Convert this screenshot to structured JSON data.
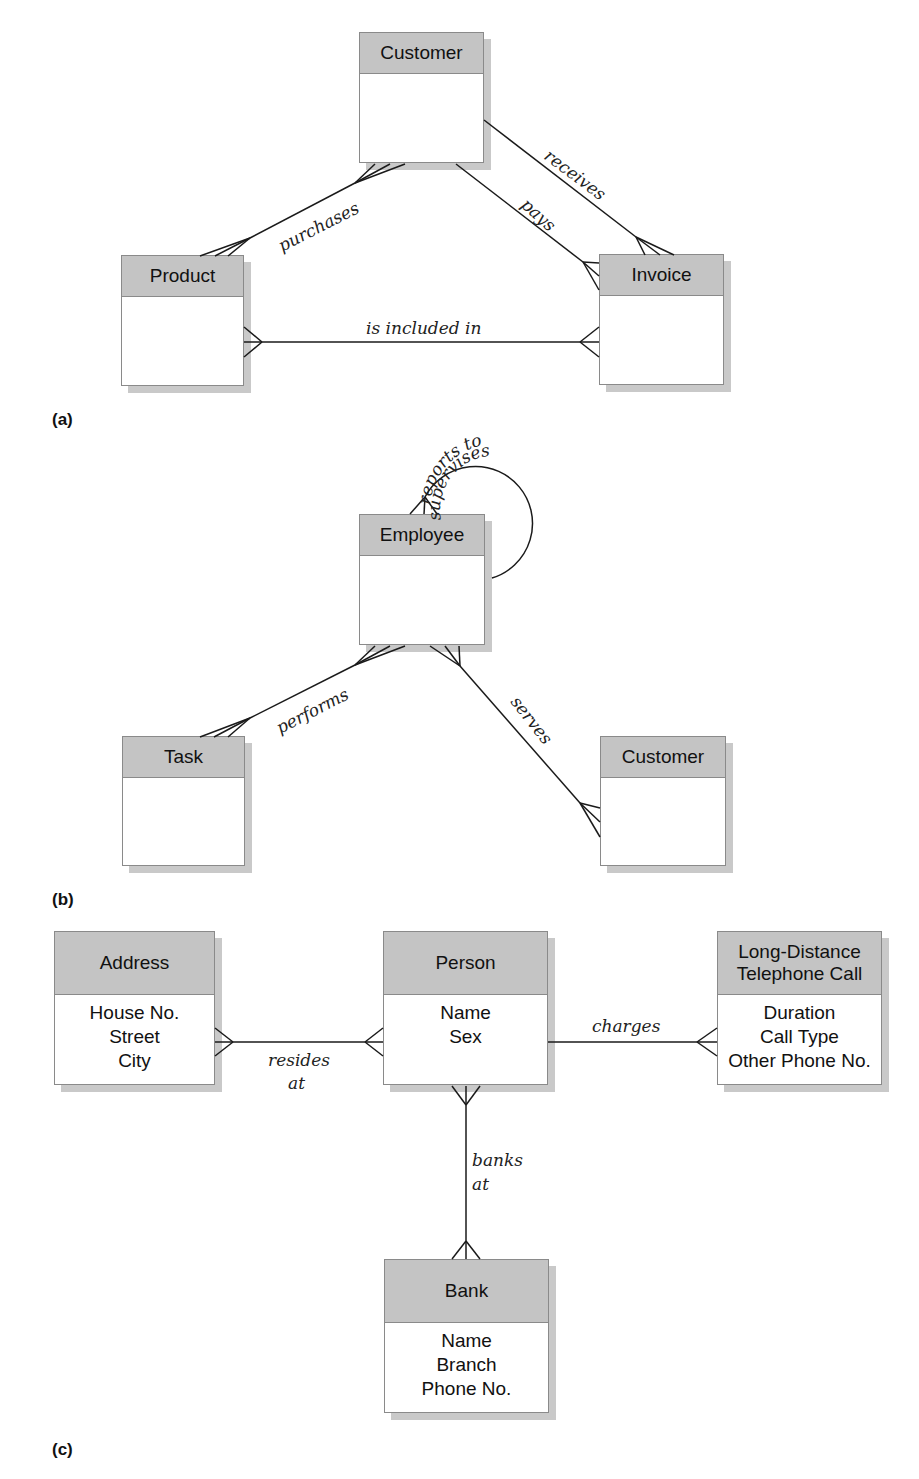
{
  "panels": [
    {
      "id": "a",
      "label": "(a)"
    },
    {
      "id": "b",
      "label": "(b)"
    },
    {
      "id": "c",
      "label": "(c)"
    }
  ],
  "entities": {
    "a_customer": {
      "name": "Customer",
      "attributes": []
    },
    "a_product": {
      "name": "Product",
      "attributes": []
    },
    "a_invoice": {
      "name": "Invoice",
      "attributes": []
    },
    "b_employee": {
      "name": "Employee",
      "attributes": []
    },
    "b_task": {
      "name": "Task",
      "attributes": []
    },
    "b_customer": {
      "name": "Customer",
      "attributes": []
    },
    "c_address": {
      "name": "Address",
      "attributes": [
        "House No.",
        "Street",
        "City"
      ]
    },
    "c_person": {
      "name": "Person",
      "attributes": [
        "Name",
        "Sex"
      ]
    },
    "c_call": {
      "name_line1": "Long-Distance",
      "name_line2": "Telephone Call",
      "attributes": [
        "Duration",
        "Call Type",
        "Other Phone No."
      ]
    },
    "c_bank": {
      "name": "Bank",
      "attributes": [
        "Name",
        "Branch",
        "Phone No."
      ]
    }
  },
  "relationships": {
    "purchases": {
      "label": "purchases",
      "from": "Customer",
      "to": "Product"
    },
    "receives": {
      "label": "receives",
      "from": "Customer",
      "to": "Invoice"
    },
    "pays": {
      "label": "pays",
      "from": "Customer",
      "to": "Invoice"
    },
    "is_included_in": {
      "label": "is included in",
      "from": "Product",
      "to": "Invoice"
    },
    "reports_to": {
      "label": "reports to",
      "from": "Employee",
      "to": "Employee"
    },
    "supervises": {
      "label": "supervises",
      "from": "Employee",
      "to": "Employee"
    },
    "performs": {
      "label": "performs",
      "from": "Employee",
      "to": "Task"
    },
    "serves": {
      "label": "serves",
      "from": "Employee",
      "to": "Customer"
    },
    "resides": {
      "label_line1": "resides",
      "label_line2": "at",
      "from": "Person",
      "to": "Address"
    },
    "charges": {
      "label": "charges",
      "from": "Person",
      "to": "Long-Distance Telephone Call"
    },
    "banks": {
      "label_line1": "banks",
      "label_line2": "at",
      "from": "Person",
      "to": "Bank"
    }
  },
  "colors": {
    "header_fill": "#c4c4c4",
    "shadow": "#c9c9c9",
    "line": "#1a1a1a",
    "border": "#8a8a8a"
  }
}
